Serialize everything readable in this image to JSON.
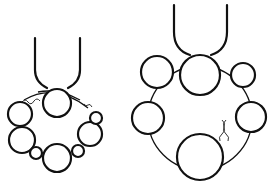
{
  "illustration": {
    "subject": "Two bead bracelets hanging from U-shaped hooks",
    "colors": {
      "line": "#111111",
      "background": "#ffffff"
    },
    "figures": [
      {
        "name": "left-bracelet",
        "description": "Small bracelet with a clasp twist, hanging bead on hook",
        "bead_count": 8
      },
      {
        "name": "right-bracelet",
        "description": "Larger bracelet ring with six beads and a twisted wire clasp",
        "bead_count": 6
      }
    ]
  }
}
